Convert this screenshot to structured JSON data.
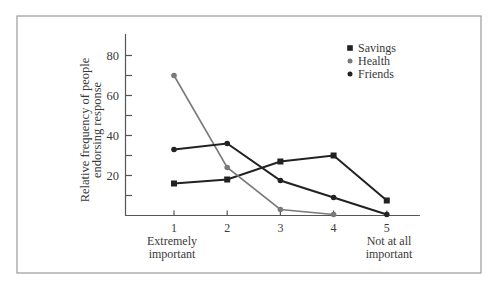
{
  "chart_data": {
    "type": "line",
    "title": "",
    "xlabel": "",
    "ylabel": "Relative frequency of people endorsing response",
    "ylabel_lines": [
      "Relative frequency of people",
      "endorsing response"
    ],
    "categories": [
      1,
      2,
      3,
      4,
      5
    ],
    "x_tick_labels": [
      "1",
      "2",
      "3",
      "4",
      "5"
    ],
    "x_end_labels": {
      "left": [
        "Extremely",
        "important"
      ],
      "right": [
        "Not at all",
        "important"
      ]
    },
    "ylim": [
      0,
      90
    ],
    "y_ticks": [
      10,
      20,
      30,
      40,
      50,
      60,
      70,
      80
    ],
    "y_tick_labels": [
      "20",
      "40",
      "60",
      "80"
    ],
    "grid": false,
    "legend_position": "upper right",
    "series": [
      {
        "name": "Savings",
        "marker": "square",
        "color": "#222222",
        "values": [
          16,
          18,
          27,
          30,
          7.5
        ]
      },
      {
        "name": "Health",
        "marker": "circle",
        "color": "#7a7a7a",
        "values": [
          70,
          24,
          3,
          0.5,
          null
        ]
      },
      {
        "name": "Friends",
        "marker": "circle",
        "color": "#222222",
        "values": [
          33,
          36,
          17.5,
          9,
          0.5
        ]
      }
    ]
  }
}
